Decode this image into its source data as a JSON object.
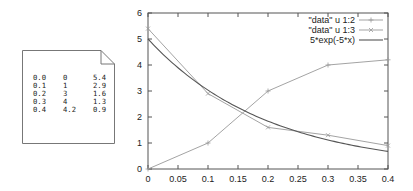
{
  "data_file": {
    "icon": "document-icon",
    "rows": [
      [
        "0.0",
        "0",
        "5.4"
      ],
      [
        "0.1",
        "1",
        "2.9"
      ],
      [
        "0.2",
        "3",
        "1.6"
      ],
      [
        "0.3",
        "4",
        "1.3"
      ],
      [
        "0.4",
        "4.2",
        "0.9"
      ]
    ]
  },
  "chart_data": {
    "type": "line",
    "title": "",
    "xlabel": "",
    "ylabel": "",
    "xlim": [
      0,
      0.4
    ],
    "ylim": [
      0,
      6
    ],
    "xticks": [
      "0",
      "0.05",
      "0.1",
      "0.15",
      "0.2",
      "0.25",
      "0.3",
      "0.35",
      "0.4"
    ],
    "xtick_values": [
      0,
      0.05,
      0.1,
      0.15,
      0.2,
      0.25,
      0.3,
      0.35,
      0.4
    ],
    "yticks": [
      "0",
      "1",
      "2",
      "3",
      "4",
      "5",
      "6"
    ],
    "ytick_values": [
      0,
      1,
      2,
      3,
      4,
      5,
      6
    ],
    "grid": false,
    "legend_position": "top-right",
    "series": [
      {
        "name": "\"data\" u 1:2",
        "x": [
          0.0,
          0.1,
          0.2,
          0.3,
          0.4
        ],
        "y": [
          0,
          1,
          3,
          4,
          4.2
        ],
        "marker": "plus",
        "color": "#999999"
      },
      {
        "name": "\"data\" u 1:3",
        "x": [
          0.0,
          0.1,
          0.2,
          0.3,
          0.4
        ],
        "y": [
          5.4,
          2.9,
          1.6,
          1.3,
          0.9
        ],
        "marker": "cross",
        "color": "#999999"
      },
      {
        "name": "5*exp(-5*x)",
        "function": "5*exp(-5*x)",
        "marker": "none",
        "color": "#555555"
      }
    ]
  }
}
